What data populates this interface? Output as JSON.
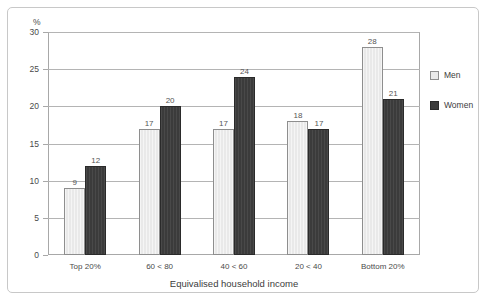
{
  "axis": {
    "unit_label": "%",
    "x_title": "Equivalised household income",
    "y_ticks": [
      "30",
      "25",
      "20",
      "15",
      "10",
      "5",
      "0"
    ]
  },
  "legend": {
    "items": [
      {
        "label": "Men",
        "color": "#e9e9e9",
        "swatch": "men-swatch-icon"
      },
      {
        "label": "Women",
        "color": "#3b3b3b",
        "swatch": "women-swatch-icon"
      }
    ]
  },
  "chart_data": {
    "type": "bar",
    "title": "",
    "xlabel": "Equivalised household income",
    "ylabel": "%",
    "ylim": [
      0,
      30
    ],
    "ytick_step": 5,
    "grid": true,
    "legend_position": "right",
    "categories": [
      "Top 20%",
      "60 < 80",
      "40 < 60",
      "20 < 40",
      "Bottom 20%"
    ],
    "series": [
      {
        "name": "Men",
        "color": "#e9e9e9",
        "values": [
          9,
          17,
          17,
          18,
          28
        ]
      },
      {
        "name": "Women",
        "color": "#3b3b3b",
        "values": [
          12,
          20,
          24,
          17,
          21
        ]
      }
    ],
    "value_labels": {
      "Men": [
        "9",
        "17",
        "17",
        "18",
        "28"
      ],
      "Women": [
        "12",
        "20",
        "24",
        "17",
        "21"
      ]
    }
  }
}
